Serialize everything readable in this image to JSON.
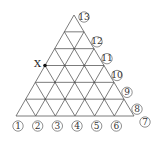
{
  "diagram": {
    "type": "triangular-lattice",
    "rows": 6,
    "apex": [
      74,
      15
    ],
    "base_left": [
      16,
      116
    ],
    "base_right": [
      134,
      116
    ],
    "line_color": "#5a5a5a",
    "point_x": {
      "label": "X",
      "row": 3,
      "position": "left-edge"
    },
    "bottom_labels": [
      "①",
      "②",
      "③",
      "④",
      "⑤",
      "⑥",
      "⑦"
    ],
    "right_labels": [
      "⑧",
      "⑨",
      "⑩",
      "⑪",
      "⑫",
      "⑬"
    ]
  }
}
